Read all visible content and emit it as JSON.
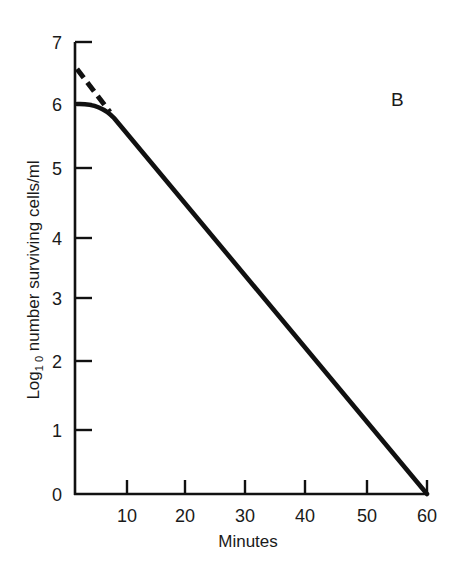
{
  "chart_data": {
    "type": "line",
    "title": "",
    "panel_label": "B",
    "xlabel": "Minutes",
    "ylabel": "Log₁₀ number surviving cells/ml",
    "ylabel_parts": {
      "pre": "Log",
      "sub": "1 0",
      "post": " number surviving cells/ml"
    },
    "xlim": [
      0,
      60
    ],
    "ylim": [
      0,
      7
    ],
    "x_ticks": [
      10,
      20,
      30,
      40,
      50,
      60
    ],
    "x_tick_labels": [
      "10",
      "20",
      "30",
      "40",
      "50",
      "60"
    ],
    "y_ticks": [
      0,
      1,
      2,
      3,
      4,
      5,
      6,
      7
    ],
    "y_tick_labels": [
      "0",
      "1",
      "2",
      "3",
      "4",
      "5",
      "6",
      "7"
    ],
    "grid": false,
    "legend": null,
    "series": [
      {
        "name": "Observed survival curve",
        "style": "solid",
        "color": "#111111",
        "x": [
          0,
          3,
          5,
          7,
          10,
          20,
          30,
          40,
          50,
          60
        ],
        "y": [
          6.0,
          5.98,
          5.93,
          5.85,
          5.6,
          4.5,
          3.35,
          2.25,
          1.1,
          0.0
        ]
      },
      {
        "name": "Extrapolation of exponential phase",
        "style": "dashed",
        "color": "#111111",
        "x": [
          0,
          7
        ],
        "y": [
          6.6,
          5.85
        ]
      }
    ]
  }
}
